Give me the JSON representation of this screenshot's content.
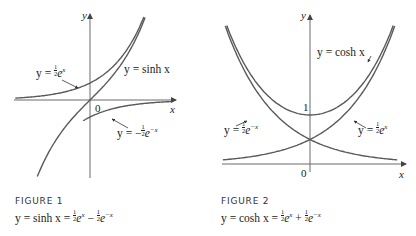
{
  "figures": [
    {
      "id": "figure-1",
      "caption_title": "FIGURE 1",
      "caption_func": "y = sinh x",
      "caption_rhs_terms": [
        "+",
        "−"
      ],
      "axis_labels": {
        "x": "x",
        "y": "y",
        "origin": "0"
      },
      "curve_labels": {
        "main": "y = sinh x",
        "pos_exp": "y = ",
        "neg_exp": "y = −"
      },
      "colors": {
        "curve": "#5a5a5a",
        "axis": "#6a6a6a"
      }
    },
    {
      "id": "figure-2",
      "caption_title": "FIGURE 2",
      "caption_func": "y = cosh x",
      "axis_labels": {
        "x": "x",
        "y": "y",
        "origin": "0",
        "one": "1"
      },
      "curve_labels": {
        "main": "y = cosh x",
        "pos_exp": "y = ",
        "neg_exp": "y = "
      },
      "colors": {
        "curve": "#5a5a5a",
        "axis": "#6a6a6a"
      }
    }
  ],
  "chart_data": [
    {
      "type": "line",
      "title": "FIGURE 1",
      "subtitle": "y = sinh x = ½eˣ − ½e⁻ˣ",
      "xlabel": "x",
      "ylabel": "y",
      "xlim": [
        -2.2,
        2.5
      ],
      "ylim": [
        -2.5,
        2.6
      ],
      "grid": false,
      "series": [
        {
          "name": "y = sinh x",
          "function": "sinh(x)"
        },
        {
          "name": "y = ½eˣ",
          "function": "0.5*exp(x)"
        },
        {
          "name": "y = −½e⁻ˣ",
          "function": "-0.5*exp(-x)"
        }
      ],
      "annotations": [
        "0"
      ]
    },
    {
      "type": "line",
      "title": "FIGURE 2",
      "subtitle": "y = cosh x = ½eˣ + ½e⁻ˣ",
      "xlabel": "x",
      "ylabel": "y",
      "xlim": [
        -1.9,
        1.9
      ],
      "ylim": [
        0,
        3.0
      ],
      "grid": false,
      "series": [
        {
          "name": "y = cosh x",
          "function": "cosh(x)"
        },
        {
          "name": "y = ½eˣ",
          "function": "0.5*exp(x)"
        },
        {
          "name": "y = ½e⁻ˣ",
          "function": "0.5*exp(-x)"
        }
      ],
      "annotations": [
        "0",
        "1"
      ]
    }
  ]
}
